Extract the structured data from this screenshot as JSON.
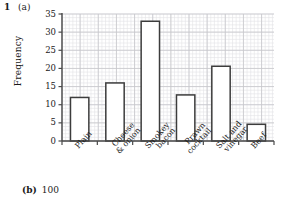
{
  "question": {
    "number": "1",
    "part_a": "(a)",
    "part_b_label": "(b)",
    "part_b_answer": "100"
  },
  "chart_data": {
    "type": "bar",
    "title": "",
    "xlabel": "",
    "ylabel": "Frequency",
    "categories": [
      "Plain",
      "Cheese\n& onion",
      "Smokey\nbacon",
      "Prawn\ncocktail",
      "Salt and\nvinegar",
      "Beef"
    ],
    "category_lines": [
      [
        "Plain"
      ],
      [
        "Cheese",
        "& onion"
      ],
      [
        "Smokey",
        "bacon"
      ],
      [
        "Prawn",
        "cocktail"
      ],
      [
        "Salt and",
        "vinegar"
      ],
      [
        "Beef"
      ]
    ],
    "values": [
      12,
      16,
      33,
      12.7,
      20.6,
      4.6
    ],
    "ylim": [
      0,
      35
    ],
    "yticks": [
      0,
      5,
      10,
      15,
      20,
      25,
      30,
      35
    ],
    "ytick_labels": [
      "0",
      "5",
      "10",
      "15",
      "20",
      "25",
      "30",
      "35"
    ],
    "grid": true,
    "grid_minor_step": 1,
    "grid_major_step": 5,
    "legend": "none",
    "bar_fill": "#ffffff",
    "bar_edge": "#3c3c3c",
    "axis_color": "#4a4a4a",
    "grid_minor_color": "#e2e2e6",
    "grid_major_color": "#c6c6cc"
  }
}
